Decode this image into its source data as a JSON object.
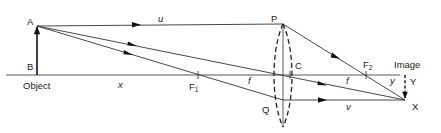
{
  "diagram": {
    "points": {
      "A": "A",
      "B": "B",
      "P": "P",
      "Q": "Q",
      "C": "C",
      "F1": "F",
      "F1_sub": "1",
      "F2": "F",
      "F2_sub": "2",
      "X": "X",
      "Y": "Y"
    },
    "labels": {
      "object": "Object",
      "image": "Image",
      "u": "u",
      "v": "v",
      "x": "x",
      "y": "y",
      "f_left": "f",
      "f_right": "f"
    },
    "rays": [
      {
        "name": "parallel-ray",
        "path": [
          "A",
          "P",
          "F2",
          "X"
        ]
      },
      {
        "name": "central-ray",
        "path": [
          "A",
          "C",
          "X"
        ]
      },
      {
        "name": "focal-ray",
        "path": [
          "A",
          "F1",
          "Q",
          "X"
        ]
      }
    ],
    "colors": {
      "ink": "#222222",
      "background": "#ffffff"
    }
  }
}
